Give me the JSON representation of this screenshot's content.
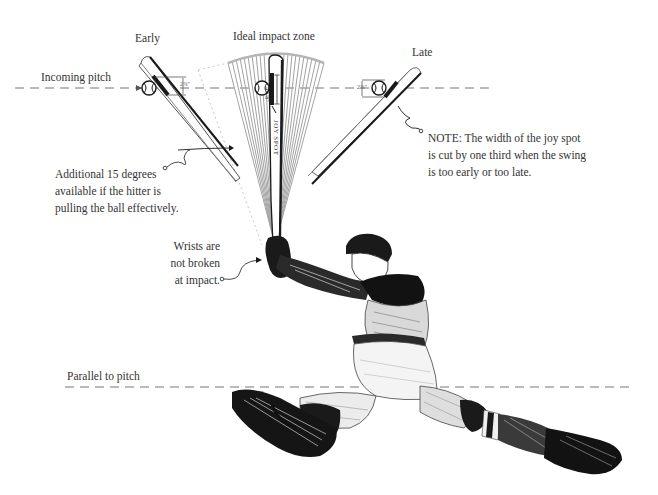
{
  "diagram": {
    "labels": {
      "early": "Early",
      "ideal_zone": "Ideal impact zone",
      "late": "Late",
      "incoming_pitch": "Incoming pitch",
      "parallel_to_pitch": "Parallel to pitch",
      "joy_spot": "JOY SPOT"
    },
    "measurements": {
      "early_joy_spot_width": "2⅞\"",
      "ideal_joy_spot_width": "4 3/8\"",
      "late_joy_spot_width": "2⅞\""
    },
    "annotations": {
      "additional_degrees": {
        "lines": [
          "Additional 15 degrees",
          "available if the hitter is",
          "pulling the ball effectively."
        ]
      },
      "wrists": {
        "lines": [
          "Wrists are",
          "not broken",
          "at impact."
        ]
      },
      "note": {
        "lines": [
          "NOTE: The width of the joy spot",
          "is cut by one third when the swing",
          "is too early or too late."
        ]
      }
    },
    "colors": {
      "ink": "#1a1a1a",
      "text": "#333333",
      "dashed_line": "#777777",
      "fan_lines": "#9a9a9a",
      "background": "#ffffff"
    }
  }
}
